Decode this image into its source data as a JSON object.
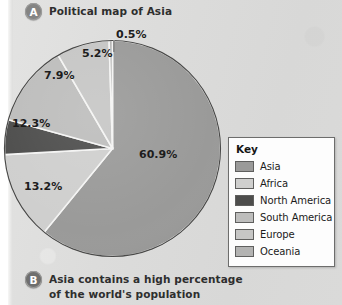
{
  "figure": {
    "caption_a": {
      "badge": "A",
      "text": "Political map of Asia"
    },
    "caption_b": {
      "badge": "B",
      "line1": "Asia contains a high percentage",
      "line2": "of the world's population"
    }
  },
  "legend": {
    "title": "Key",
    "items": [
      {
        "label": "Asia",
        "color": "#9a9a99"
      },
      {
        "label": "Africa",
        "color": "#cfcfce"
      },
      {
        "label": "North America",
        "color": "#4d4d4c"
      },
      {
        "label": "South America",
        "color": "#bdbdbc"
      },
      {
        "label": "Europe",
        "color": "#c6c6c5"
      },
      {
        "label": "Oceania",
        "color": "#b3b3b2"
      }
    ]
  },
  "chart_data": {
    "type": "pie",
    "title": "Political map of Asia",
    "unit": "%",
    "legend_position": "right",
    "grid": false,
    "categories": [
      "Asia",
      "Africa",
      "North America",
      "South America",
      "Europe",
      "Oceania"
    ],
    "values": [
      60.9,
      13.2,
      5.2,
      12.3,
      7.9,
      0.5
    ],
    "labels": [
      "60.9%",
      "13.2%",
      "5.2%",
      "12.3%",
      "7.9%",
      "0.5%"
    ],
    "colors": [
      "#9a9a99",
      "#cfcfce",
      "#4d4d4c",
      "#bdbdbc",
      "#c6c6c5",
      "#b3b3b2"
    ],
    "start_angle_deg": 0,
    "direction": "clockwise",
    "annotation": "Asia contains a high percentage of the world's population"
  }
}
